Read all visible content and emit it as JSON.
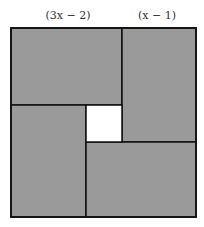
{
  "labels": {
    "top_left": "(3x − 2)",
    "top_right": "(x − 1)"
  },
  "colors": {
    "fill": "#9a9a9a",
    "stroke": "#111111",
    "hole": "#ffffff"
  },
  "diagram": {
    "outer_square": {
      "x": 11,
      "y": 28,
      "w": 185,
      "h": 189
    },
    "rectangles": [
      {
        "name": "top-left",
        "x": 11,
        "y": 28,
        "w": 111,
        "h": 77
      },
      {
        "name": "top-right",
        "x": 122,
        "y": 28,
        "w": 74,
        "h": 114
      },
      {
        "name": "bottom-left",
        "x": 11,
        "y": 105,
        "w": 75,
        "h": 112
      },
      {
        "name": "bottom-right",
        "x": 86,
        "y": 142,
        "w": 110,
        "h": 75
      }
    ],
    "center_square": {
      "x": 86,
      "y": 105,
      "w": 36,
      "h": 37
    }
  }
}
